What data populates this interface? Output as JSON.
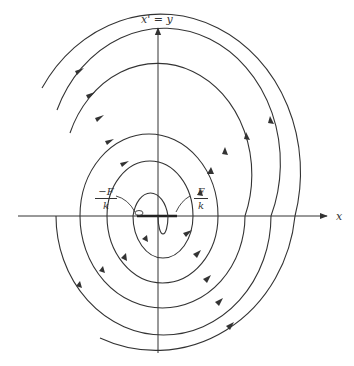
{
  "diagram": {
    "type": "phase-plane-spiral",
    "y_axis_label": "x' = y",
    "x_axis_label": "x",
    "left_marker": {
      "numerator": "−F",
      "denominator": "k"
    },
    "right_marker": {
      "numerator": "F",
      "denominator": "k"
    },
    "colors": {
      "stroke": "#333333",
      "background": "#ffffff"
    },
    "origin_px": [
      158,
      216
    ],
    "equilibrium_segment_px": [
      137,
      177
    ],
    "axis_crossings_left_px": [
      56,
      80,
      107,
      133
    ],
    "axis_crossings_right_px": [
      193,
      218,
      245,
      271,
      295
    ],
    "flow_direction": "clockwise, spiraling inward"
  }
}
